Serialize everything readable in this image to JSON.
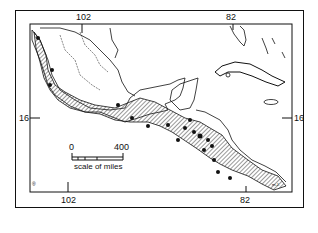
{
  "map": {
    "title": "Distribution map, Mexico and Central America",
    "longitude_labels_top": [
      "102",
      "82"
    ],
    "longitude_labels_bottom": [
      "102",
      "82"
    ],
    "latitude_labels": {
      "left": "16",
      "right": "16"
    },
    "scale_bar": {
      "start": "0",
      "end": "400",
      "caption": "scale of miles"
    },
    "corner_marks": {
      "bottom_left": "®",
      "bottom_right": "m.J."
    },
    "colors": {
      "ink": "#111111",
      "hatch": "#333333",
      "background": "#ffffff"
    }
  }
}
